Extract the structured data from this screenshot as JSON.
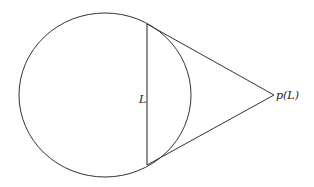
{
  "diagram": {
    "chord_label": "L",
    "point_label": "p(L)",
    "stroke_color": "#333333",
    "circle": {
      "cx": 105,
      "cy": 95,
      "rx": 86,
      "ry": 82
    },
    "chord": {
      "x1": 147,
      "y1": 24,
      "x2": 147,
      "y2": 165
    },
    "apex": {
      "x": 274,
      "y": 95
    }
  }
}
